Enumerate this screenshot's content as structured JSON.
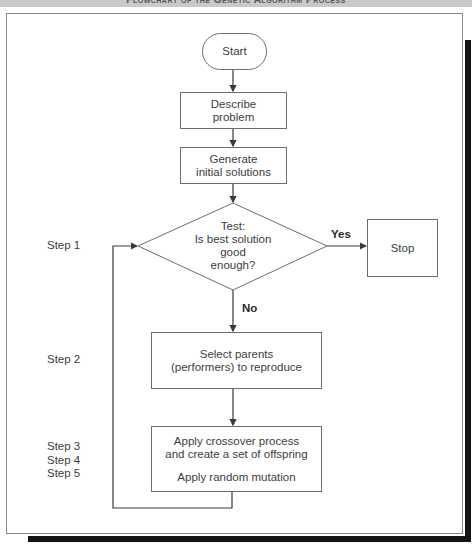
{
  "header": {
    "title": "Flowchart of the Genetic Algorithm Process"
  },
  "nodes": {
    "start": {
      "label": "Start"
    },
    "describe": {
      "line1": "Describe",
      "line2": "problem"
    },
    "generate": {
      "line1": "Generate",
      "line2": "initial solutions"
    },
    "test": {
      "line1": "Test:",
      "line2": "Is best solution",
      "line3": "good",
      "line4": "enough?"
    },
    "stop": {
      "label": "Stop"
    },
    "select": {
      "line1": "Select parents",
      "line2": "(performers) to reproduce"
    },
    "crossover": {
      "line1": "Apply crossover process",
      "line2": "and create a set of offspring",
      "line3": "Apply random mutation"
    }
  },
  "edges": {
    "yes_label": "Yes",
    "no_label": "No"
  },
  "steps": [
    {
      "label": "Step 1"
    },
    {
      "label": "Step 2"
    },
    {
      "label": "Step 3"
    },
    {
      "label": "Step 4"
    },
    {
      "label": "Step 5"
    }
  ],
  "colors": {
    "line": "#4a4a4a",
    "border": "#6e6e6e",
    "header_band": "#c9c9c9",
    "shadow": "#141414"
  }
}
